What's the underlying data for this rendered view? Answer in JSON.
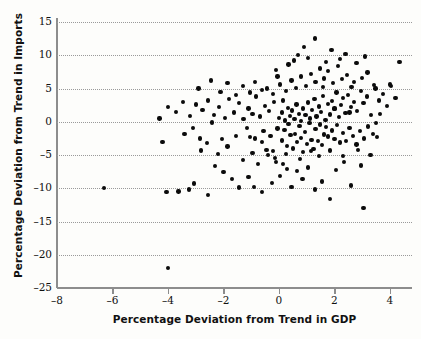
{
  "chart_data": {
    "type": "scatter",
    "title": "",
    "xlabel": "Percentage Deviation from Trend in GDP",
    "ylabel": "Percentage Deviation from Trend in Imports",
    "xlim": [
      -8,
      4.8
    ],
    "ylim": [
      -25,
      15
    ],
    "xticks": [
      -8,
      -6,
      -4,
      -2,
      0,
      2,
      4
    ],
    "yticks": [
      15,
      10,
      5,
      0,
      -5,
      -10,
      -15,
      -20,
      -25
    ],
    "xtick_labels": [
      "–8",
      "–6",
      "–4",
      "–2",
      "0",
      "2",
      "4"
    ],
    "ytick_labels": [
      "15",
      "10",
      "5",
      "0",
      "–5",
      "–10",
      "–15",
      "–20",
      "–25"
    ],
    "grid": "horizontal-dotted",
    "legend": "none",
    "marker": "filled-circle",
    "marker_color": "#0b0b0b",
    "points": [
      [
        -6.3,
        -10.0
      ],
      [
        -4.0,
        -22.0
      ],
      [
        -4.05,
        -10.6
      ],
      [
        -3.62,
        -10.5
      ],
      [
        -3.25,
        -10.2
      ],
      [
        -3.05,
        -9.3
      ],
      [
        -2.55,
        -11.0
      ],
      [
        -2.4,
        -0.1
      ],
      [
        -2.05,
        -2.6
      ],
      [
        -1.85,
        -3.7
      ],
      [
        -1.55,
        -2.1
      ],
      [
        -1.3,
        -5.7
      ],
      [
        -1.15,
        -0.9
      ],
      [
        -1.05,
        -2.3
      ],
      [
        -0.95,
        -4.7
      ],
      [
        -0.85,
        -2.5
      ],
      [
        -0.75,
        -6.4
      ],
      [
        -0.62,
        -3.0
      ],
      [
        -0.55,
        -1.4
      ],
      [
        -0.45,
        -4.2
      ],
      [
        -0.38,
        -5.0
      ],
      [
        -0.3,
        -2.1
      ],
      [
        -0.2,
        -4.4
      ],
      [
        -0.1,
        -6.0
      ],
      [
        -2.8,
        -4.3
      ],
      [
        -2.6,
        -3.2
      ],
      [
        -2.3,
        -6.7
      ],
      [
        -2.2,
        -4.9
      ],
      [
        -2.0,
        -7.6
      ],
      [
        -1.7,
        -8.6
      ],
      [
        -1.45,
        -9.9
      ],
      [
        -1.1,
        -8.3
      ],
      [
        -0.9,
        -9.8
      ],
      [
        -0.6,
        -10.6
      ],
      [
        -0.25,
        -9.2
      ],
      [
        0.05,
        -8.2
      ],
      [
        0.15,
        -6.3
      ],
      [
        0.3,
        -7.1
      ],
      [
        0.45,
        -9.8
      ],
      [
        0.65,
        -7.4
      ],
      [
        0.85,
        -8.6
      ],
      [
        1.05,
        -6.9
      ],
      [
        1.3,
        -10.2
      ],
      [
        1.55,
        -9.0
      ],
      [
        1.85,
        -11.6
      ],
      [
        2.05,
        -7.3
      ],
      [
        2.35,
        -6.0
      ],
      [
        2.6,
        -9.6
      ],
      [
        3.05,
        -13.0
      ],
      [
        2.95,
        -6.6
      ],
      [
        3.3,
        -5.0
      ],
      [
        3.55,
        -2.3
      ],
      [
        -0.05,
        -1.0
      ],
      [
        0.1,
        -2.8
      ],
      [
        0.2,
        -1.2
      ],
      [
        0.28,
        -3.6
      ],
      [
        0.35,
        -0.3
      ],
      [
        0.42,
        -2.0
      ],
      [
        0.5,
        -4.0
      ],
      [
        0.58,
        -1.8
      ],
      [
        0.66,
        -3.0
      ],
      [
        0.74,
        -0.6
      ],
      [
        0.8,
        -2.4
      ],
      [
        0.88,
        -4.6
      ],
      [
        0.95,
        -1.5
      ],
      [
        1.02,
        -3.3
      ],
      [
        1.1,
        -0.2
      ],
      [
        1.18,
        -2.7
      ],
      [
        1.25,
        -4.1
      ],
      [
        1.32,
        -1.1
      ],
      [
        1.4,
        -2.9
      ],
      [
        1.48,
        -0.4
      ],
      [
        1.55,
        -3.5
      ],
      [
        1.62,
        -1.9
      ],
      [
        1.7,
        -0.8
      ],
      [
        1.78,
        -2.2
      ],
      [
        1.85,
        -4.3
      ],
      [
        1.92,
        -1.3
      ],
      [
        2.0,
        -2.6
      ],
      [
        2.1,
        -0.5
      ],
      [
        2.2,
        -3.1
      ],
      [
        2.3,
        -1.7
      ],
      [
        2.42,
        -2.9
      ],
      [
        2.55,
        -0.9
      ],
      [
        2.68,
        -2.1
      ],
      [
        2.8,
        -3.4
      ],
      [
        2.92,
        -1.4
      ],
      [
        3.08,
        -2.5
      ],
      [
        3.22,
        -0.7
      ],
      [
        3.4,
        -1.8
      ],
      [
        0.0,
        0.6
      ],
      [
        0.12,
        1.4
      ],
      [
        0.22,
        0.2
      ],
      [
        0.32,
        2.1
      ],
      [
        0.4,
        0.9
      ],
      [
        0.48,
        1.7
      ],
      [
        0.56,
        0.4
      ],
      [
        0.64,
        2.6
      ],
      [
        0.72,
        1.2
      ],
      [
        0.8,
        0.1
      ],
      [
        0.88,
        2.0
      ],
      [
        0.96,
        1.0
      ],
      [
        1.04,
        2.9
      ],
      [
        1.12,
        0.5
      ],
      [
        1.2,
        1.8
      ],
      [
        1.28,
        3.4
      ],
      [
        1.36,
        0.8
      ],
      [
        1.44,
        2.3
      ],
      [
        1.52,
        1.5
      ],
      [
        1.6,
        3.9
      ],
      [
        1.68,
        0.3
      ],
      [
        1.76,
        2.7
      ],
      [
        1.84,
        1.1
      ],
      [
        1.92,
        3.1
      ],
      [
        2.0,
        1.9
      ],
      [
        2.08,
        4.4
      ],
      [
        2.16,
        0.7
      ],
      [
        2.24,
        2.5
      ],
      [
        2.32,
        3.6
      ],
      [
        2.4,
        1.3
      ],
      [
        2.5,
        4.0
      ],
      [
        2.6,
        2.2
      ],
      [
        2.7,
        3.0
      ],
      [
        2.82,
        1.6
      ],
      [
        2.95,
        4.6
      ],
      [
        3.05,
        2.8
      ],
      [
        3.18,
        3.8
      ],
      [
        3.32,
        1.0
      ],
      [
        3.48,
        5.0
      ],
      [
        3.6,
        3.2
      ],
      [
        3.75,
        4.2
      ],
      [
        3.9,
        2.4
      ],
      [
        4.05,
        5.4
      ],
      [
        4.2,
        3.6
      ],
      [
        4.35,
        9.0
      ],
      [
        4.0,
        5.6
      ],
      [
        -0.18,
        3.0
      ],
      [
        -0.35,
        1.6
      ],
      [
        -0.5,
        2.4
      ],
      [
        -0.68,
        0.8
      ],
      [
        -0.82,
        3.8
      ],
      [
        -0.95,
        1.2
      ],
      [
        -1.1,
        2.0
      ],
      [
        -1.28,
        0.4
      ],
      [
        -1.45,
        2.8
      ],
      [
        -1.62,
        1.4
      ],
      [
        -1.8,
        3.4
      ],
      [
        -1.95,
        0.6
      ],
      [
        -2.15,
        2.2
      ],
      [
        -2.35,
        1.0
      ],
      [
        -2.55,
        3.2
      ],
      [
        -2.75,
        1.8
      ],
      [
        -3.0,
        2.6
      ],
      [
        -3.2,
        0.9
      ],
      [
        -3.45,
        3.0
      ],
      [
        -3.7,
        1.5
      ],
      [
        -4.0,
        2.2
      ],
      [
        -4.3,
        0.5
      ],
      [
        -0.42,
        5.0
      ],
      [
        -0.2,
        4.2
      ],
      [
        0.05,
        5.6
      ],
      [
        0.25,
        4.6
      ],
      [
        0.45,
        6.2
      ],
      [
        0.62,
        5.1
      ],
      [
        0.8,
        6.8
      ],
      [
        0.98,
        5.4
      ],
      [
        1.15,
        7.2
      ],
      [
        1.32,
        6.0
      ],
      [
        1.48,
        8.0
      ],
      [
        1.62,
        6.5
      ],
      [
        1.78,
        7.6
      ],
      [
        1.95,
        5.8
      ],
      [
        2.12,
        8.4
      ],
      [
        2.28,
        6.4
      ],
      [
        2.45,
        7.0
      ],
      [
        2.62,
        5.2
      ],
      [
        2.8,
        8.8
      ],
      [
        3.0,
        6.6
      ],
      [
        3.2,
        7.4
      ],
      [
        3.42,
        5.5
      ],
      [
        -0.6,
        4.8
      ],
      [
        -0.85,
        6.0
      ],
      [
        -1.05,
        4.4
      ],
      [
        -1.3,
        5.4
      ],
      [
        -1.55,
        4.0
      ],
      [
        -1.85,
        5.8
      ],
      [
        -2.1,
        4.5
      ],
      [
        -2.45,
        6.2
      ],
      [
        -2.9,
        5.0
      ],
      [
        0.7,
        10.0
      ],
      [
        1.3,
        12.5
      ],
      [
        0.55,
        9.2
      ],
      [
        2.4,
        10.2
      ],
      [
        1.05,
        9.6
      ],
      [
        1.9,
        10.8
      ],
      [
        2.2,
        9.4
      ],
      [
        3.1,
        9.8
      ],
      [
        0.9,
        11.2
      ],
      [
        1.7,
        9.0
      ],
      [
        -0.1,
        7.8
      ],
      [
        0.35,
        8.6
      ],
      [
        2.0,
        2.0
      ],
      [
        2.55,
        1.4
      ],
      [
        1.45,
        -5.2
      ],
      [
        1.15,
        -4.4
      ],
      [
        0.75,
        -5.6
      ],
      [
        0.25,
        -4.9
      ],
      [
        -0.15,
        -5.4
      ],
      [
        2.85,
        -4.2
      ],
      [
        2.3,
        -5.1
      ],
      [
        3.5,
        -0.2
      ],
      [
        3.65,
        1.2
      ],
      [
        -3.4,
        -1.8
      ],
      [
        -3.1,
        -0.9
      ],
      [
        -2.85,
        -2.5
      ],
      [
        -4.2,
        -3.0
      ],
      [
        -0.05,
        6.8
      ],
      [
        0.15,
        3.2
      ],
      [
        1.6,
        5.2
      ],
      [
        2.7,
        6.0
      ]
    ]
  }
}
